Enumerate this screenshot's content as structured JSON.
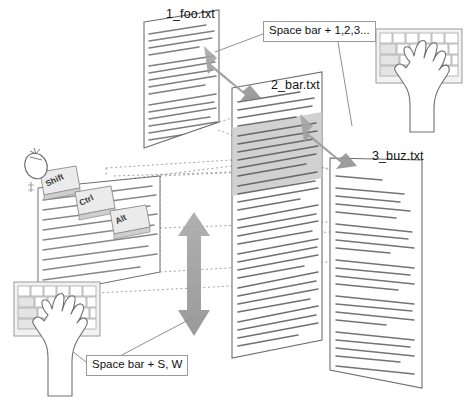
{
  "diagram": {
    "background_color": "#ffffff",
    "ink_color": "#1a1a1a",
    "arrow_color": "#9c9c9c",
    "highlight_color": "#c9c9c9",
    "page_fill": "#ffffff",
    "page_stroke": "#6e6e6e",
    "text_line_color": "#555555",
    "dotted_guide_color": "#8c8c8c"
  },
  "file_panels": [
    {
      "id": "foo",
      "label": "1_foo.txt",
      "has_highlight": false
    },
    {
      "id": "bar",
      "label": "2_bar.txt",
      "has_highlight": true
    },
    {
      "id": "buz",
      "label": "3_buz.txt",
      "has_highlight": false
    }
  ],
  "callouts": [
    {
      "id": "top",
      "text": "Space bar + 1,2,3..."
    },
    {
      "id": "bottom",
      "text": "Space bar + S, W"
    }
  ],
  "modifier_keys": [
    {
      "label": "Shift"
    },
    {
      "label": "Ctrl"
    },
    {
      "label": "Alt"
    }
  ],
  "hand_illustrations": [
    {
      "id": "top-right",
      "name": "hand-on-keyboard"
    },
    {
      "id": "bottom-left",
      "name": "hand-on-keyboard"
    }
  ],
  "pointer_device": {
    "name": "mouse"
  },
  "arrows": [
    {
      "id": "foo-bar",
      "style": "double-headed",
      "direction": "diagonal"
    },
    {
      "id": "bar-buz",
      "style": "double-headed",
      "direction": "diagonal"
    },
    {
      "id": "vertical",
      "style": "double-headed",
      "direction": "vertical"
    }
  ]
}
